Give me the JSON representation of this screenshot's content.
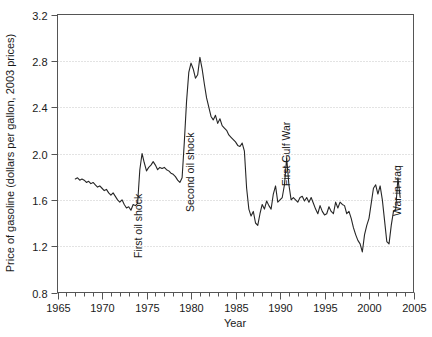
{
  "chart_data": {
    "type": "line",
    "title": "",
    "subtitle": "",
    "xlabel": "Year",
    "ylabel": "Price of gasoline (dollars per gallon, 2003 prices)",
    "xlim": [
      1965,
      2005
    ],
    "ylim": [
      0.8,
      3.2
    ],
    "xticks": [
      1965,
      1970,
      1975,
      1980,
      1985,
      1990,
      1995,
      2000,
      2005
    ],
    "xtick_labels": [
      "1965",
      "1970",
      "1975",
      "1980",
      "1985",
      "1990",
      "1995",
      "2000",
      "2005"
    ],
    "yticks": [
      0.8,
      1.2,
      1.6,
      2.0,
      2.4,
      2.8,
      3.2
    ],
    "ytick_labels": [
      "0.8",
      "1.2",
      "1.6",
      "2.0",
      "2.4",
      "2.8",
      "3.2"
    ],
    "x_minor_tick_interval": 1,
    "grid": "horizontal-dotted",
    "gridlines_at": [
      1.2,
      1.6,
      2.0,
      2.4,
      2.8
    ],
    "legend": "none",
    "line_color": "#262626",
    "line_width": 1.1,
    "series": [
      {
        "name": "Price of gasoline (2003 dollars per gallon)",
        "x": [
          1967.0,
          1967.25,
          1967.5,
          1967.75,
          1968.0,
          1968.25,
          1968.5,
          1968.75,
          1969.0,
          1969.25,
          1969.5,
          1969.75,
          1970.0,
          1970.25,
          1970.5,
          1970.75,
          1971.0,
          1971.25,
          1971.5,
          1971.75,
          1972.0,
          1972.25,
          1972.5,
          1972.75,
          1973.0,
          1973.25,
          1973.5,
          1973.75,
          1974.0,
          1974.25,
          1974.5,
          1974.75,
          1975.0,
          1975.25,
          1975.5,
          1975.75,
          1976.0,
          1976.25,
          1976.5,
          1976.75,
          1977.0,
          1977.25,
          1977.5,
          1977.75,
          1978.0,
          1978.25,
          1978.5,
          1978.75,
          1979.0,
          1979.25,
          1979.5,
          1979.75,
          1980.0,
          1980.25,
          1980.5,
          1980.75,
          1981.0,
          1981.25,
          1981.5,
          1981.75,
          1982.0,
          1982.25,
          1982.5,
          1982.75,
          1983.0,
          1983.25,
          1983.5,
          1983.75,
          1984.0,
          1984.25,
          1984.5,
          1984.75,
          1985.0,
          1985.25,
          1985.5,
          1985.75,
          1986.0,
          1986.25,
          1986.5,
          1986.75,
          1987.0,
          1987.25,
          1987.5,
          1987.75,
          1988.0,
          1988.25,
          1988.5,
          1988.75,
          1989.0,
          1989.25,
          1989.5,
          1989.75,
          1990.0,
          1990.25,
          1990.5,
          1990.75,
          1991.0,
          1991.25,
          1991.5,
          1991.75,
          1992.0,
          1992.25,
          1992.5,
          1992.75,
          1993.0,
          1993.25,
          1993.5,
          1993.75,
          1994.0,
          1994.25,
          1994.5,
          1994.75,
          1995.0,
          1995.25,
          1995.5,
          1995.75,
          1996.0,
          1996.25,
          1996.5,
          1996.75,
          1997.0,
          1997.25,
          1997.5,
          1997.75,
          1998.0,
          1998.25,
          1998.5,
          1998.75,
          1999.0,
          1999.25,
          1999.5,
          1999.75,
          2000.0,
          2000.25,
          2000.5,
          2000.75,
          2001.0,
          2001.25,
          2001.5,
          2001.75,
          2002.0,
          2002.25,
          2002.5,
          2002.75,
          2003.0,
          2003.25,
          2003.5
        ],
        "values": [
          1.78,
          1.79,
          1.77,
          1.78,
          1.77,
          1.75,
          1.76,
          1.74,
          1.75,
          1.73,
          1.71,
          1.72,
          1.7,
          1.68,
          1.69,
          1.66,
          1.64,
          1.66,
          1.63,
          1.6,
          1.58,
          1.6,
          1.56,
          1.53,
          1.54,
          1.51,
          1.56,
          1.55,
          1.57,
          1.86,
          2.0,
          1.92,
          1.85,
          1.88,
          1.9,
          1.93,
          1.9,
          1.86,
          1.88,
          1.87,
          1.88,
          1.86,
          1.85,
          1.83,
          1.82,
          1.8,
          1.77,
          1.75,
          1.79,
          2.1,
          2.45,
          2.7,
          2.78,
          2.73,
          2.65,
          2.68,
          2.83,
          2.73,
          2.6,
          2.48,
          2.4,
          2.32,
          2.29,
          2.33,
          2.26,
          2.3,
          2.24,
          2.22,
          2.2,
          2.16,
          2.14,
          2.12,
          2.1,
          2.07,
          2.06,
          2.09,
          2.02,
          1.7,
          1.52,
          1.46,
          1.5,
          1.4,
          1.38,
          1.48,
          1.56,
          1.52,
          1.59,
          1.55,
          1.52,
          1.65,
          1.72,
          1.58,
          1.6,
          1.62,
          1.73,
          1.96,
          1.73,
          1.6,
          1.62,
          1.6,
          1.58,
          1.62,
          1.63,
          1.59,
          1.62,
          1.58,
          1.62,
          1.57,
          1.52,
          1.48,
          1.55,
          1.5,
          1.47,
          1.48,
          1.54,
          1.5,
          1.48,
          1.58,
          1.53,
          1.58,
          1.56,
          1.55,
          1.48,
          1.5,
          1.44,
          1.36,
          1.3,
          1.25,
          1.22,
          1.15,
          1.3,
          1.38,
          1.44,
          1.57,
          1.7,
          1.73,
          1.65,
          1.72,
          1.6,
          1.42,
          1.24,
          1.22,
          1.38,
          1.5,
          1.52,
          1.79,
          1.62
        ]
      }
    ],
    "annotations": [
      {
        "text": "First oil shock",
        "x": 1974.0,
        "rotation": -90
      },
      {
        "text": "Second oil shock",
        "x": 1979.9,
        "rotation": -90
      },
      {
        "text": "First Gulf War",
        "x": 1990.7,
        "rotation": -90
      },
      {
        "text": "War in Iraq",
        "x": 2003.2,
        "rotation": -90
      }
    ]
  }
}
